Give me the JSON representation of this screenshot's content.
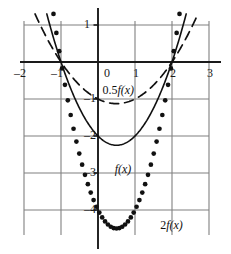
{
  "figure": {
    "title": "",
    "background": "#ffffff",
    "grid_color": "#808080",
    "axis_color": "#1a1a1a",
    "curve_color": "#111111"
  },
  "axes": {
    "x_ticks": [
      {
        "value": -2,
        "label": "–2"
      },
      {
        "value": -1,
        "label": "–1"
      },
      {
        "value": 0,
        "label": "0"
      },
      {
        "value": 1,
        "label": "1"
      },
      {
        "value": 2,
        "label": "2"
      },
      {
        "value": 3,
        "label": "3"
      }
    ],
    "y_ticks": [
      {
        "value": 1,
        "label": "1"
      },
      {
        "value": 0,
        "label": "0"
      },
      {
        "value": -1,
        "label": "–1"
      },
      {
        "value": -2,
        "label": "–2"
      },
      {
        "value": -3,
        "label": "–3"
      },
      {
        "value": -4,
        "label": "–4"
      }
    ],
    "xlim": [
      -2.35,
      3.35
    ],
    "ylim": [
      -4.85,
      1.25
    ],
    "grid": true
  },
  "labels": {
    "half_f": {
      "coef": "0.5",
      "fn": "f(x)"
    },
    "f": {
      "coef": "",
      "fn": "f(x)"
    },
    "two_f": {
      "coef": "2",
      "fn": "f(x)"
    }
  },
  "chart_data": {
    "type": "line",
    "title": "",
    "xlabel": "",
    "ylabel": "",
    "xlim": [
      -2.35,
      3.35
    ],
    "ylim": [
      -4.85,
      1.25
    ],
    "grid": true,
    "legend_position": "inline-annotations",
    "x_ticks": [
      -2,
      -1,
      0,
      1,
      2,
      3
    ],
    "y_ticks": [
      1,
      0,
      -1,
      -2,
      -3,
      -4
    ],
    "roots": [
      -1,
      2
    ],
    "vertex_x": 0.5,
    "series": [
      {
        "name": "0.5f(x)",
        "style": "dashed",
        "formula": "0.5(x+1)(x-2)",
        "vertex": [
          0.5,
          -1.125
        ],
        "x": [
          -1.55,
          -1.4,
          -1.2,
          -1.0,
          -0.8,
          -0.6,
          -0.4,
          -0.2,
          0.0,
          0.2,
          0.4,
          0.5,
          0.6,
          0.8,
          1.0,
          1.2,
          1.4,
          1.6,
          1.8,
          2.0,
          2.2,
          2.4,
          2.55
        ],
        "y": [
          1.26,
          0.88,
          0.44,
          0.0,
          -0.36,
          -0.65,
          -0.88,
          -1.03,
          -1.0,
          -1.08,
          -1.12,
          -1.125,
          -1.12,
          -1.08,
          -1.0,
          -0.88,
          -0.72,
          -0.52,
          -0.28,
          0.0,
          0.32,
          0.68,
          0.96
        ]
      },
      {
        "name": "f(x)",
        "style": "solid",
        "formula": "(x+1)(x-2)",
        "vertex": [
          0.5,
          -2.25
        ],
        "x": [
          -1.45,
          -1.3,
          -1.15,
          -1.0,
          -0.8,
          -0.6,
          -0.4,
          -0.2,
          0.0,
          0.2,
          0.4,
          0.5,
          0.6,
          0.8,
          1.0,
          1.2,
          1.4,
          1.6,
          1.8,
          2.0,
          2.15,
          2.3,
          2.45
        ],
        "y": [
          1.18,
          0.69,
          0.32,
          0.0,
          -0.72,
          -1.3,
          -1.76,
          -2.06,
          -2.0,
          -2.16,
          -2.24,
          -2.25,
          -2.24,
          -2.16,
          -2.0,
          -1.76,
          -1.44,
          -1.04,
          -0.56,
          0.0,
          0.48,
          1.0,
          1.23
        ]
      },
      {
        "name": "2f(x)",
        "style": "dotted",
        "formula": "2(x+1)(x-2)",
        "vertex": [
          0.5,
          -4.5
        ],
        "x": [
          -1.3,
          -1.2,
          -1.1,
          -1.0,
          -0.9,
          -0.8,
          -0.7,
          -0.6,
          -0.5,
          -0.4,
          -0.3,
          -0.2,
          -0.1,
          0.0,
          0.1,
          0.2,
          0.3,
          0.4,
          0.5,
          0.6,
          0.7,
          0.8,
          0.9,
          1.0,
          1.1,
          1.2,
          1.3,
          1.4,
          1.5,
          1.6,
          1.7,
          1.8,
          1.9,
          2.0,
          2.1,
          2.2,
          2.3
        ],
        "y": [
          1.38,
          0.64,
          0.0,
          0.0,
          -0.58,
          -1.44,
          -2.04,
          -2.6,
          -3.0,
          -3.52,
          -3.78,
          -4.12,
          -4.2,
          -4.0,
          -4.4,
          -4.32,
          -4.42,
          -4.48,
          -4.5,
          -4.48,
          -4.42,
          -4.32,
          -4.18,
          -4.0,
          -3.78,
          -3.52,
          -3.22,
          -2.88,
          -2.5,
          -2.08,
          -1.62,
          -1.12,
          -0.58,
          0.0,
          0.64,
          1.32,
          1.38
        ]
      }
    ]
  }
}
